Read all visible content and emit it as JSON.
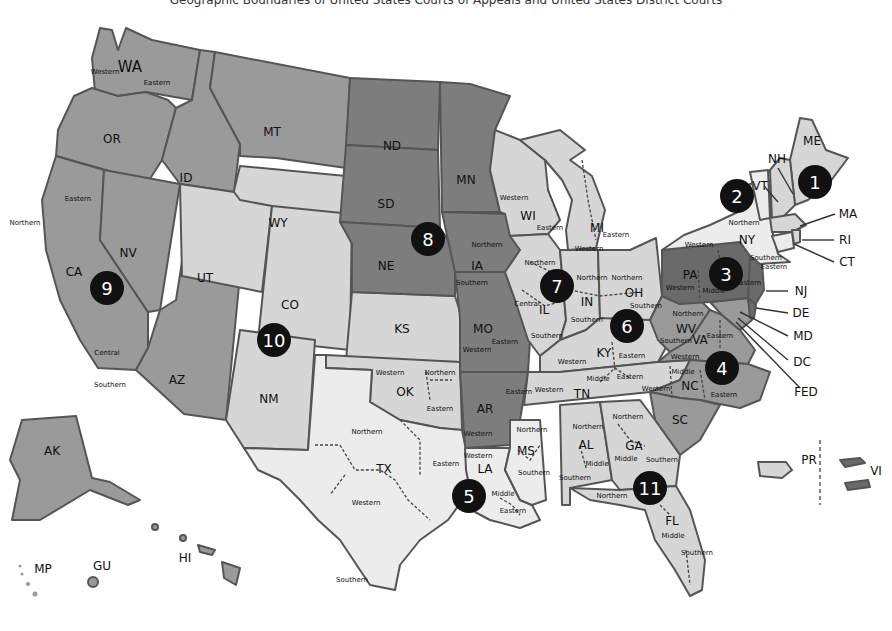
{
  "title": "Geographic Boundaries of United States Courts of Appeals and United States District Courts",
  "colors": {
    "ninth": "#9a9a9a",
    "eighth": "#7d7d7d",
    "tenth": "#d6d6d6",
    "fifth": "#ececec",
    "third": "#6a6a6a",
    "circle": "#111111",
    "border": "#555555"
  },
  "circuits": [
    {
      "number": "1",
      "x": 815,
      "y": 182
    },
    {
      "number": "2",
      "x": 737,
      "y": 196
    },
    {
      "number": "3",
      "x": 726,
      "y": 274
    },
    {
      "number": "4",
      "x": 722,
      "y": 368
    },
    {
      "number": "5",
      "x": 469,
      "y": 496
    },
    {
      "number": "6",
      "x": 627,
      "y": 326
    },
    {
      "number": "7",
      "x": 557,
      "y": 286
    },
    {
      "number": "8",
      "x": 428,
      "y": 239
    },
    {
      "number": "9",
      "x": 107,
      "y": 288
    },
    {
      "number": "10",
      "x": 274,
      "y": 340
    },
    {
      "number": "11",
      "x": 650,
      "y": 488
    }
  ],
  "states": {
    "WA": "WA",
    "OR": "OR",
    "CA": "CA",
    "NV": "NV",
    "ID": "ID",
    "MT": "MT",
    "AZ": "AZ",
    "AK": "AK",
    "HI": "HI",
    "GU": "GU",
    "MP": "MP",
    "WY": "WY",
    "UT": "UT",
    "CO": "CO",
    "NM": "NM",
    "KS": "KS",
    "OK": "OK",
    "ND": "ND",
    "SD": "SD",
    "NE": "NE",
    "MN": "MN",
    "IA": "IA",
    "MO": "MO",
    "AR": "AR",
    "TX": "TX",
    "LA": "LA",
    "MS": "MS",
    "WI": "WI",
    "IL": "IL",
    "IN": "IN",
    "MI": "MI",
    "OH": "OH",
    "KY": "KY",
    "TN": "TN",
    "WV": "WV",
    "VA": "VA",
    "NC": "NC",
    "SC": "SC",
    "MD": "MD",
    "PA": "PA",
    "NJ": "NJ",
    "DE": "DE",
    "VI": "VI",
    "NY": "NY",
    "VT": "VT",
    "CT": "CT",
    "ME": "ME",
    "NH": "NH",
    "MA": "MA",
    "RI": "RI",
    "PR": "PR",
    "AL": "AL",
    "GA": "GA",
    "FL": "FL",
    "DC": "DC",
    "FED": "FED"
  },
  "districts": {
    "wa_w": "Western",
    "wa_e": "Eastern",
    "ca_n": "Northern",
    "ca_e": "Eastern",
    "ca_c": "Central",
    "ca_s": "Southern",
    "ia_n": "Northern",
    "ia_s": "Southern",
    "mo_w": "Western",
    "mo_e": "Eastern",
    "ar_w": "Western",
    "ar_e": "Eastern",
    "ok_w": "Western",
    "ok_n": "Northern",
    "ok_e": "Eastern",
    "tx_n": "Northern",
    "tx_e": "Eastern",
    "tx_w": "Western",
    "tx_s": "Southern",
    "la_w": "Western",
    "la_m": "Middle",
    "la_e": "Eastern",
    "ms_n": "Northern",
    "ms_s": "Southern",
    "wi_w": "Western",
    "wi_e": "Eastern",
    "il_n": "Northern",
    "il_c": "Central",
    "il_s": "Southern",
    "in_n": "Northern",
    "in_s": "Southern",
    "mi_w": "Western",
    "mi_e": "Eastern",
    "oh_n": "Northern",
    "oh_s": "Southern",
    "ky_w": "Western",
    "ky_e": "Eastern",
    "tn_w": "Western",
    "tn_m": "Middle",
    "tn_e": "Eastern",
    "wv_n": "Northern",
    "wv_s": "Southern",
    "va_w": "Western",
    "va_e": "Eastern",
    "nc_w": "Western",
    "nc_m": "Middle",
    "nc_e": "Eastern",
    "pa_w": "Western",
    "pa_m": "Middle",
    "pa_e": "Eastern",
    "ny_w": "Western",
    "ny_n": "Northern",
    "ny_s": "Southern",
    "ny_e": "Eastern",
    "al_n": "Northern",
    "al_m": "Middle",
    "al_s": "Southern",
    "ga_n": "Northern",
    "ga_m": "Middle",
    "ga_s": "Southern",
    "fl_n": "Northern",
    "fl_m": "Middle",
    "fl_s": "Southern"
  }
}
